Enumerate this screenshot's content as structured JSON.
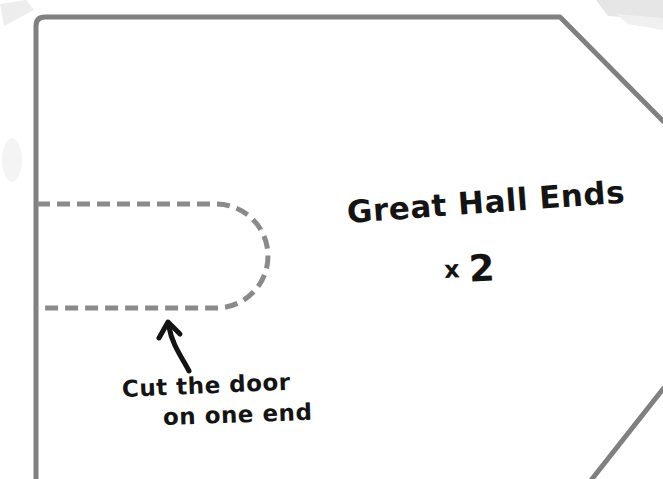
{
  "diagram": {
    "kind": "sewing-pattern-panel",
    "background_color": "#ffffff",
    "outline_color": "#808080",
    "dashed_color": "#8a8a8a",
    "ink_color": "#141414",
    "paper_smudge_color": "#e9e9e9"
  },
  "labels": {
    "piece_name": "Great Hall Ends",
    "quantity_prefix": "x",
    "quantity_number": "2",
    "instruction_line1": "Cut the door",
    "instruction_line2": "on one end"
  },
  "shapes": {
    "panel_outline_name": "great-hall-end-panel-outline",
    "door_cutout_name": "door-cutout-dashed-outline",
    "arrow_name": "curved-arrow-to-door"
  }
}
